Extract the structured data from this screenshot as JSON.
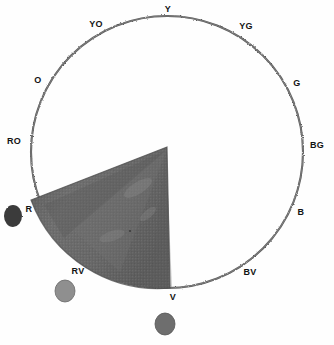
{
  "figure": {
    "type": "color-wheel-diagram",
    "background_color": "#fefefe",
    "ink_color": "#131313"
  },
  "wheel": {
    "center": {
      "x": 167,
      "y": 152
    },
    "radius": 136,
    "stroke_color": "#555555",
    "stroke_width": 2
  },
  "labels": [
    {
      "id": "Y",
      "text": "Y",
      "x": 168,
      "y": 9,
      "angle_deg": 90
    },
    {
      "id": "YG",
      "text": "YG",
      "x": 246,
      "y": 26,
      "angle_deg": 60
    },
    {
      "id": "G",
      "text": "G",
      "x": 297,
      "y": 83,
      "angle_deg": 30
    },
    {
      "id": "BG",
      "text": "BG",
      "x": 317,
      "y": 145,
      "angle_deg": 0
    },
    {
      "id": "B",
      "text": "B",
      "x": 301,
      "y": 212,
      "angle_deg": 330
    },
    {
      "id": "BV",
      "text": "BV",
      "x": 250,
      "y": 272,
      "angle_deg": 300
    },
    {
      "id": "V",
      "text": "V",
      "x": 173,
      "y": 297,
      "angle_deg": 270
    },
    {
      "id": "RV",
      "text": "RV",
      "x": 78,
      "y": 271,
      "angle_deg": 240
    },
    {
      "id": "R",
      "text": "R",
      "x": 29,
      "y": 209,
      "angle_deg": 210
    },
    {
      "id": "RO",
      "text": "RO",
      "x": 14,
      "y": 141,
      "angle_deg": 180
    },
    {
      "id": "O",
      "text": "O",
      "x": 38,
      "y": 80,
      "angle_deg": 150
    },
    {
      "id": "YO",
      "text": "YO",
      "x": 96,
      "y": 24,
      "angle_deg": 120
    }
  ],
  "wedge": {
    "name": "shaded-sector",
    "start_label": "R",
    "end_label": "V",
    "start_angle_deg": 180,
    "end_angle_deg": 270,
    "apex": {
      "x": 167,
      "y": 147
    },
    "fill_color": "#6f6f6f",
    "fill_color_dark": "#5a5a5a",
    "fill_color_light": "#8a8a8a"
  },
  "swatches": [
    {
      "id": "swatch-r",
      "near_label": "R",
      "x": 13,
      "y": 216,
      "rx": 9,
      "ry": 11,
      "color": "#3b3b3b"
    },
    {
      "id": "swatch-rv",
      "near_label": "RV",
      "x": 65,
      "y": 291,
      "rx": 10,
      "ry": 11,
      "color": "#8f8f8f"
    },
    {
      "id": "swatch-v",
      "near_label": "V",
      "x": 165,
      "y": 324,
      "rx": 10,
      "ry": 11,
      "color": "#6e6e6e"
    }
  ]
}
